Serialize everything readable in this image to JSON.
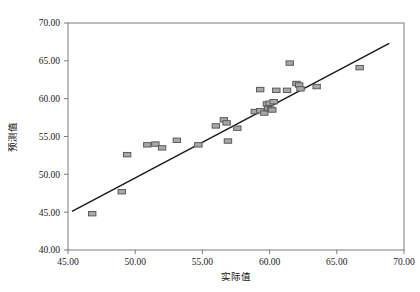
{
  "chart_data": {
    "type": "scatter",
    "title": "",
    "xlabel": "实际值",
    "ylabel": "预测值",
    "xlim": [
      45.0,
      70.0
    ],
    "ylim": [
      40.0,
      70.0
    ],
    "xticks": [
      "45.00",
      "50.00",
      "55.00",
      "60.00",
      "65.00",
      "70.00"
    ],
    "xtick_values": [
      45.0,
      50.0,
      55.0,
      60.0,
      65.0,
      70.0
    ],
    "yticks": [
      "40.00",
      "45.00",
      "50.00",
      "55.00",
      "60.00",
      "65.00",
      "70.00"
    ],
    "ytick_values": [
      40.0,
      45.0,
      50.0,
      55.0,
      60.0,
      65.0,
      70.0
    ],
    "grid": false,
    "legend": null,
    "marker_shape": "rectangle",
    "marker_fill": "#a8a8a8",
    "marker_edge": "#5a5a5a",
    "line_color": "#1a1a1a",
    "frame_color": "#7a7a7a",
    "points": [
      {
        "x": 46.8,
        "y": 44.8
      },
      {
        "x": 49.0,
        "y": 47.7
      },
      {
        "x": 49.4,
        "y": 52.6
      },
      {
        "x": 50.9,
        "y": 53.9
      },
      {
        "x": 51.5,
        "y": 54.0
      },
      {
        "x": 52.0,
        "y": 53.5
      },
      {
        "x": 53.1,
        "y": 54.5
      },
      {
        "x": 54.7,
        "y": 53.9
      },
      {
        "x": 56.0,
        "y": 56.4
      },
      {
        "x": 56.6,
        "y": 57.2
      },
      {
        "x": 56.8,
        "y": 56.8
      },
      {
        "x": 56.9,
        "y": 54.4
      },
      {
        "x": 57.6,
        "y": 56.1
      },
      {
        "x": 58.9,
        "y": 58.3
      },
      {
        "x": 59.3,
        "y": 58.4
      },
      {
        "x": 59.6,
        "y": 58.1
      },
      {
        "x": 59.8,
        "y": 59.3
      },
      {
        "x": 59.9,
        "y": 58.7
      },
      {
        "x": 60.0,
        "y": 59.4
      },
      {
        "x": 60.1,
        "y": 58.6
      },
      {
        "x": 60.2,
        "y": 58.5
      },
      {
        "x": 60.3,
        "y": 59.6
      },
      {
        "x": 60.5,
        "y": 61.1
      },
      {
        "x": 59.3,
        "y": 61.2
      },
      {
        "x": 61.3,
        "y": 61.1
      },
      {
        "x": 61.5,
        "y": 64.7
      },
      {
        "x": 62.0,
        "y": 62.0
      },
      {
        "x": 62.2,
        "y": 61.8
      },
      {
        "x": 62.3,
        "y": 61.3
      },
      {
        "x": 63.5,
        "y": 61.6
      },
      {
        "x": 66.7,
        "y": 64.1
      }
    ],
    "fit_line": {
      "x_start": 45.3,
      "y_start": 45.1,
      "x_end": 68.9,
      "y_end": 67.3
    }
  },
  "axes": {
    "x_title": "实际值",
    "y_title": "预测值"
  }
}
